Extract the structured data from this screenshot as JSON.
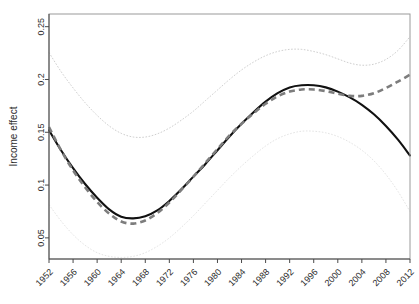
{
  "chart_data": {
    "type": "line",
    "title": "",
    "xlabel": "",
    "ylabel": "Income effect",
    "xlim": [
      1952,
      2012
    ],
    "ylim": [
      0.03,
      0.262
    ],
    "grid": false,
    "legend": "none",
    "x_ticks": [
      1952,
      1956,
      1960,
      1964,
      1968,
      1972,
      1976,
      1980,
      1984,
      1988,
      1992,
      1996,
      2000,
      2004,
      2008,
      2012
    ],
    "x_tick_labels": [
      "1952",
      "1956",
      "1960",
      "1964",
      "1968",
      "1972",
      "1976",
      "1980",
      "1984",
      "1988",
      "1992",
      "1996",
      "2000",
      "2004",
      "2008",
      "2012"
    ],
    "y_ticks": [
      0.05,
      0.1,
      0.15,
      0.2,
      0.25
    ],
    "y_tick_labels": [
      "0.05",
      "0.1",
      "0.15",
      "0.2",
      "0.25"
    ],
    "x": [
      1952,
      1954,
      1956,
      1958,
      1960,
      1962,
      1964,
      1966,
      1968,
      1970,
      1972,
      1974,
      1976,
      1978,
      1980,
      1982,
      1984,
      1986,
      1988,
      1990,
      1992,
      1994,
      1996,
      1998,
      2000,
      2002,
      2004,
      2006,
      2008,
      2010,
      2012
    ],
    "series": [
      {
        "name": "estimate",
        "style": "solid",
        "color": "#111111",
        "values": [
          0.152,
          0.133,
          0.116,
          0.101,
          0.088,
          0.077,
          0.07,
          0.0685,
          0.0705,
          0.076,
          0.085,
          0.096,
          0.108,
          0.12,
          0.133,
          0.146,
          0.158,
          0.169,
          0.179,
          0.187,
          0.1925,
          0.1945,
          0.1945,
          0.1925,
          0.1885,
          0.183,
          0.176,
          0.167,
          0.156,
          0.143,
          0.128
        ]
      },
      {
        "name": "comparison",
        "style": "dashed",
        "color": "#7d7d7d",
        "values": [
          0.155,
          0.133,
          0.114,
          0.098,
          0.084,
          0.073,
          0.0655,
          0.0635,
          0.0665,
          0.0735,
          0.0835,
          0.0955,
          0.108,
          0.121,
          0.134,
          0.147,
          0.158,
          0.168,
          0.177,
          0.184,
          0.1885,
          0.1905,
          0.1905,
          0.189,
          0.1865,
          0.1845,
          0.1845,
          0.187,
          0.192,
          0.198,
          0.2045
        ]
      },
      {
        "name": "upper-confidence-band",
        "style": "dotted",
        "color": "#cfcfcf",
        "values": [
          0.2255,
          0.2075,
          0.192,
          0.178,
          0.166,
          0.156,
          0.149,
          0.1455,
          0.1455,
          0.1485,
          0.154,
          0.1615,
          0.17,
          0.18,
          0.19,
          0.2,
          0.209,
          0.2165,
          0.2225,
          0.2265,
          0.2285,
          0.2285,
          0.2265,
          0.2235,
          0.2195,
          0.2155,
          0.2135,
          0.2145,
          0.219,
          0.2275,
          0.2405
        ]
      },
      {
        "name": "lower-confidence-band",
        "style": "dotted",
        "color": "#e4e4e4",
        "values": [
          0.0815,
          0.066,
          0.053,
          0.043,
          0.036,
          0.0325,
          0.0315,
          0.0325,
          0.036,
          0.042,
          0.05,
          0.06,
          0.071,
          0.083,
          0.095,
          0.107,
          0.118,
          0.128,
          0.137,
          0.144,
          0.1485,
          0.151,
          0.151,
          0.1495,
          0.146,
          0.1405,
          0.133,
          0.123,
          0.11,
          0.094,
          0.075
        ]
      }
    ]
  },
  "axes": {
    "y_title": "Income effect"
  }
}
